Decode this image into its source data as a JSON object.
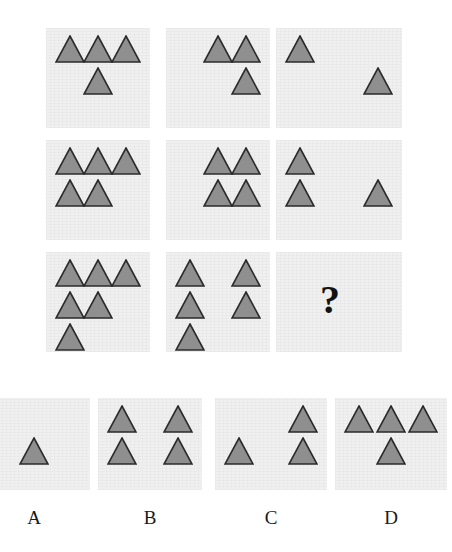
{
  "puzzle": {
    "type": "ravens-progressive-matrix",
    "shape": "triangle",
    "shape_fill": "#8f8f8f",
    "shape_stroke": "#2b2b2b",
    "panel_background": "#f0f0f0",
    "page_background": "#ffffff",
    "missing_cell_marker": "?",
    "matrix_rows": 3,
    "matrix_cols": 3,
    "matrix": {
      "cells": [
        {
          "id": "cell-r1c1",
          "row": 1,
          "col": 1,
          "count": 4,
          "description": "three triangles in top row, one triangle centered below",
          "triangles": [
            {
              "col": 1,
              "row": 1
            },
            {
              "col": 2,
              "row": 1
            },
            {
              "col": 3,
              "row": 1
            },
            {
              "col": 2,
              "row": 2
            }
          ]
        },
        {
          "id": "cell-r1c2",
          "row": 1,
          "col": 2,
          "count": 3,
          "description": "two triangles in top row, one triangle below right",
          "triangles": [
            {
              "col": 2,
              "row": 1
            },
            {
              "col": 3,
              "row": 1
            },
            {
              "col": 3,
              "row": 2
            }
          ]
        },
        {
          "id": "cell-r1c3",
          "row": 1,
          "col": 3,
          "count": 2,
          "description": "one triangle upper left, one triangle lower right",
          "triangles": [
            {
              "col": 1,
              "row": 1
            },
            {
              "col": 3,
              "row": 2
            }
          ]
        },
        {
          "id": "cell-r2c1",
          "row": 2,
          "col": 1,
          "count": 5,
          "description": "three triangles in top row, two triangles below left",
          "triangles": [
            {
              "col": 1,
              "row": 1
            },
            {
              "col": 2,
              "row": 1
            },
            {
              "col": 3,
              "row": 1
            },
            {
              "col": 1,
              "row": 2
            },
            {
              "col": 2,
              "row": 2
            }
          ]
        },
        {
          "id": "cell-r2c2",
          "row": 2,
          "col": 2,
          "count": 4,
          "description": "two by two block of triangles",
          "triangles": [
            {
              "col": 2,
              "row": 1
            },
            {
              "col": 3,
              "row": 1
            },
            {
              "col": 2,
              "row": 2
            },
            {
              "col": 3,
              "row": 2
            }
          ]
        },
        {
          "id": "cell-r2c3",
          "row": 2,
          "col": 3,
          "count": 3,
          "description": "one triangle top left, two triangles in bottom row",
          "triangles": [
            {
              "col": 1,
              "row": 1
            },
            {
              "col": 1,
              "row": 2
            },
            {
              "col": 3,
              "row": 2
            }
          ]
        },
        {
          "id": "cell-r3c1",
          "row": 3,
          "col": 1,
          "count": 6,
          "description": "three triangles, two triangles, one triangle stacked",
          "triangles": [
            {
              "col": 1,
              "row": 1
            },
            {
              "col": 2,
              "row": 1
            },
            {
              "col": 3,
              "row": 1
            },
            {
              "col": 1,
              "row": 2
            },
            {
              "col": 2,
              "row": 2
            },
            {
              "col": 1,
              "row": 3
            }
          ]
        },
        {
          "id": "cell-r3c2",
          "row": 3,
          "col": 2,
          "count": 5,
          "description": "two triangles, two triangles, one triangle stacked",
          "triangles": [
            {
              "col": 1,
              "row": 1
            },
            {
              "col": 3,
              "row": 1
            },
            {
              "col": 1,
              "row": 2
            },
            {
              "col": 3,
              "row": 2
            },
            {
              "col": 1,
              "row": 3
            }
          ]
        },
        {
          "id": "cell-r3c3",
          "row": 3,
          "col": 3,
          "count": 0,
          "is_missing": true,
          "marker": "?",
          "description": "missing cell marked with a question mark",
          "triangles": []
        }
      ]
    },
    "options": [
      {
        "id": "option-a",
        "label": "A",
        "count": 4,
        "clipped_at_left_edge": true,
        "description": "three triangles in left column clipped by image edge, one triangle middle of second row",
        "triangles": [
          {
            "col": 0,
            "row": 1
          },
          {
            "col": 0,
            "row": 2
          },
          {
            "col": 2,
            "row": 2
          },
          {
            "col": 0,
            "row": 3
          }
        ]
      },
      {
        "id": "option-b",
        "label": "B",
        "count": 4,
        "clipped_at_left_edge": false,
        "description": "two by two block of triangles",
        "triangles": [
          {
            "col": 1,
            "row": 1
          },
          {
            "col": 3,
            "row": 1
          },
          {
            "col": 1,
            "row": 2
          },
          {
            "col": 3,
            "row": 2
          }
        ]
      },
      {
        "id": "option-c",
        "label": "C",
        "count": 3,
        "clipped_at_left_edge": false,
        "description": "one triangle top right, two triangles in bottom row",
        "triangles": [
          {
            "col": 3,
            "row": 1
          },
          {
            "col": 1,
            "row": 2
          },
          {
            "col": 3,
            "row": 2
          }
        ]
      },
      {
        "id": "option-d",
        "label": "D",
        "count": 4,
        "clipped_at_left_edge": false,
        "description": "three triangles in top row, one triangle centered below",
        "triangles": [
          {
            "col": 1,
            "row": 1
          },
          {
            "col": 2,
            "row": 1
          },
          {
            "col": 3,
            "row": 1
          },
          {
            "col": 2,
            "row": 2
          }
        ]
      }
    ]
  },
  "geometry": {
    "matrix_panel_x": [
      46,
      166,
      276
    ],
    "matrix_panel_y": [
      28,
      140,
      252
    ],
    "matrix_panel_w": [
      104,
      104,
      126
    ],
    "matrix_panel_h": [
      100,
      100,
      100
    ],
    "option_panel_x": [
      -22,
      98,
      215,
      335
    ],
    "option_panel_y": 398,
    "option_panel_w": [
      112,
      104,
      112,
      112
    ],
    "option_panel_h": 92,
    "option_label_y": 508,
    "triangle_size": 30,
    "qmark_x": 320,
    "qmark_y": 280
  }
}
